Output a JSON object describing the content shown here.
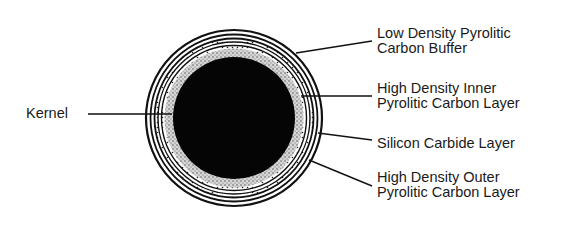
{
  "figure": {
    "type": "cross-section"
  },
  "colors": {
    "ink": "#111111",
    "background": "#ffffff",
    "speckle": "#bdbdbd"
  },
  "labels": {
    "kernel": {
      "lines": [
        "Kernel"
      ]
    },
    "buffer": {
      "lines": [
        "Low Density Pyrolitic",
        "Carbon Buffer"
      ]
    },
    "inner_pyc": {
      "lines": [
        "High Density Inner",
        "Pyrolitic Carbon Layer"
      ]
    },
    "sic": {
      "lines": [
        "Silicon Carbide Layer"
      ]
    },
    "outer_pyc": {
      "lines": [
        "High Density Outer",
        "Pyrolitic Carbon Layer"
      ]
    }
  }
}
